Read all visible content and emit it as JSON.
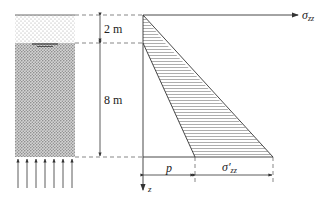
{
  "diagram": {
    "labels": {
      "layer_top_thickness": "2 m",
      "layer_bottom_thickness": "8 m",
      "axis_sigma_symbol": "σ",
      "axis_sigma_sub": "zz",
      "axis_z": "z",
      "pore_pressure": "p",
      "effective_stress_symbol": "σ′",
      "effective_stress_sub": "zz"
    },
    "colors": {
      "line": "#333333",
      "dash": "#555555",
      "hatch": "#666666",
      "dry_soil_dot": "#999999",
      "saturated_soil": "#bdbdbd"
    }
  }
}
